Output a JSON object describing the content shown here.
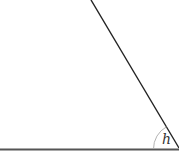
{
  "diagram": {
    "type": "angle-figure",
    "angle_label": "h",
    "colors": {
      "line": "#222222",
      "base": "#555555",
      "arc": "#aaaaaa",
      "label": "#333333"
    }
  }
}
